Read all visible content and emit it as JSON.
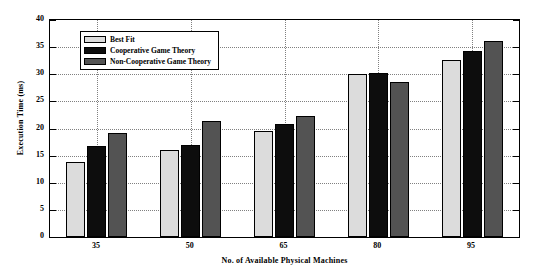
{
  "chart_data": {
    "type": "bar",
    "title": "",
    "xlabel": "No. of Available Physical Machines",
    "ylabel": "Execution Time (ms)",
    "categories": [
      "35",
      "50",
      "65",
      "80",
      "95"
    ],
    "ylim": [
      0,
      40
    ],
    "yticks": [
      0,
      5,
      10,
      15,
      20,
      25,
      30,
      35,
      40
    ],
    "grid": "dotted-both",
    "legend_position": "upper-left-inside",
    "series": [
      {
        "name": "Best Fit",
        "color": "#dcdcdc",
        "values": [
          13.8,
          16.0,
          19.5,
          30.0,
          32.7
        ]
      },
      {
        "name": "Cooperative Game Theory",
        "color": "#0d0d0d",
        "values": [
          16.8,
          17.0,
          20.8,
          30.2,
          34.2
        ]
      },
      {
        "name": "Non-Cooperative Game Theory",
        "color": "#535353",
        "values": [
          19.2,
          21.3,
          22.3,
          28.5,
          36.1
        ]
      }
    ]
  }
}
